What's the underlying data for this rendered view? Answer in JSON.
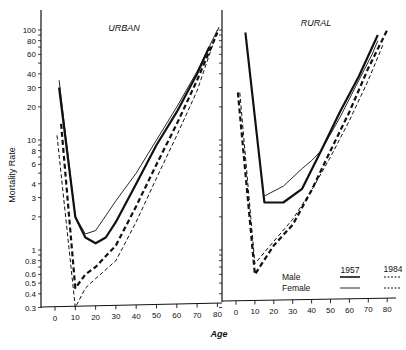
{
  "chart_data": {
    "type": "line",
    "title": "",
    "xlabel": "Age",
    "ylabel": "Mortality Rate",
    "yscale": "log",
    "ylim": [
      0.3,
      120
    ],
    "xlim": [
      0,
      80
    ],
    "x_ticks": [
      0,
      10,
      20,
      30,
      40,
      50,
      60,
      70,
      80
    ],
    "y_ticks": [
      0.3,
      0.4,
      0.5,
      0.6,
      0.8,
      1,
      2,
      3,
      4,
      6,
      8,
      10,
      20,
      30,
      40,
      60,
      80,
      100
    ],
    "y_tick_labels": [
      "0.3",
      "0.4",
      "0.5",
      "0.6",
      "0.8",
      "1",
      "2",
      "3",
      "4",
      "6",
      "8",
      "10",
      "20",
      "30",
      "40",
      "60",
      "80",
      "100"
    ],
    "grid": false,
    "legend": {
      "position": "lower right (rural panel)",
      "columns": [
        "1957",
        "1984"
      ],
      "rows": [
        "Male",
        "Female"
      ],
      "entries": [
        {
          "label": "Male 1957",
          "style": "thick solid"
        },
        {
          "label": "Female 1957",
          "style": "thin solid"
        },
        {
          "label": "Male 1984",
          "style": "thick dashed"
        },
        {
          "label": "Female 1984",
          "style": "thin dashed"
        }
      ]
    },
    "panels": [
      {
        "title": "URBAN",
        "series": [
          {
            "name": "Male 1957",
            "style": "thick-solid",
            "x": [
              2,
              10,
              15,
              20,
              25,
              30,
              40,
              50,
              60,
              70,
              76
            ],
            "values": [
              30,
              2.0,
              1.3,
              1.15,
              1.3,
              1.8,
              4,
              9,
              18,
              40,
              70
            ]
          },
          {
            "name": "Female 1957",
            "style": "thin-solid",
            "x": [
              2,
              10,
              15,
              20,
              30,
              40,
              50,
              60,
              70,
              80
            ],
            "values": [
              35,
              2.0,
              1.4,
              1.5,
              2.8,
              5,
              10,
              20,
              42,
              100
            ]
          },
          {
            "name": "Male 1984",
            "style": "thick-dashed",
            "x": [
              3,
              10,
              15,
              20,
              30,
              40,
              50,
              60,
              70,
              80
            ],
            "values": [
              14,
              0.45,
              0.6,
              0.7,
              1.1,
              2.5,
              6,
              14,
              35,
              95
            ]
          },
          {
            "name": "Female 1984",
            "style": "thin-dashed",
            "x": [
              1,
              10,
              15,
              20,
              30,
              40,
              50,
              60,
              70,
              81
            ],
            "values": [
              11,
              0.3,
              0.45,
              0.55,
              0.8,
              1.8,
              4.5,
              11,
              28,
              110
            ]
          }
        ]
      },
      {
        "title": "RURAL",
        "series": [
          {
            "name": "Male 1957",
            "style": "thick-solid",
            "x": [
              5,
              15,
              25,
              35,
              45,
              55,
              65,
              75
            ],
            "values": [
              95,
              2.7,
              2.7,
              3.6,
              8,
              18,
              38,
              90
            ]
          },
          {
            "name": "Female 1957",
            "style": "thin-solid",
            "x": [
              15,
              25,
              35,
              40,
              45,
              55,
              65,
              72,
              75
            ],
            "values": [
              3.1,
              3.8,
              5.5,
              6.5,
              8,
              16,
              35,
              60,
              80
            ]
          },
          {
            "name": "Male 1984",
            "style": "thick-dashed",
            "x": [
              1,
              10,
              20,
              30,
              40,
              50,
              60,
              70,
              80
            ],
            "values": [
              27,
              0.6,
              1.1,
              1.7,
              3.5,
              8,
              18,
              45,
              100
            ]
          },
          {
            "name": "Female 1984",
            "style": "thin-dashed",
            "x": [
              2,
              10,
              20,
              30,
              40,
              50,
              60,
              70,
              78
            ],
            "values": [
              27,
              0.75,
              1.2,
              1.9,
              3.5,
              7,
              15,
              35,
              75
            ]
          }
        ]
      }
    ]
  },
  "labels": {
    "ylabel": "Mortality Rate",
    "xlabel": "Age",
    "urban_title": "URBAN",
    "rural_title": "RURAL",
    "legend_col_1957": "1957",
    "legend_col_1984": "1984",
    "legend_row_male": "Male",
    "legend_row_female": "Female"
  }
}
